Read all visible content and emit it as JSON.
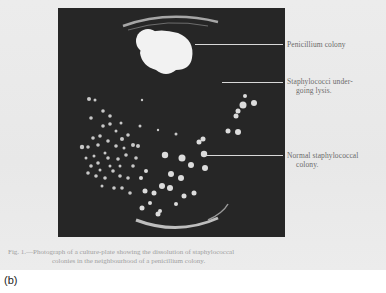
{
  "figure": {
    "panel_label": "(b)",
    "annotations": [
      {
        "id": "penicillium",
        "line1": "Penicillium colony",
        "line2": ""
      },
      {
        "id": "lysis",
        "line1": "Staphylococci  under-",
        "line2": "going lysis."
      },
      {
        "id": "normal",
        "line1": "Normal staphylococcal",
        "line2": "colony."
      }
    ],
    "caption": {
      "line1": "Fig. 1.—Photograph of a culture-plate showing the dissolution of staphylococcal",
      "line2": "colonies in the neighbourhood of a penicillium colony."
    },
    "colors": {
      "photo_background": "#262626",
      "colony": "#e8e8e8",
      "page_gray": "#eaeaea"
    }
  }
}
